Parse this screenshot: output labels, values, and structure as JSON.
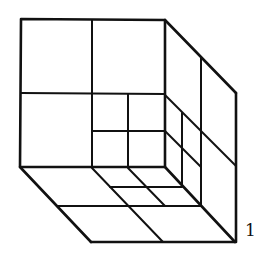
{
  "figure": {
    "label": "1",
    "stroke_color": "#111111"
  }
}
